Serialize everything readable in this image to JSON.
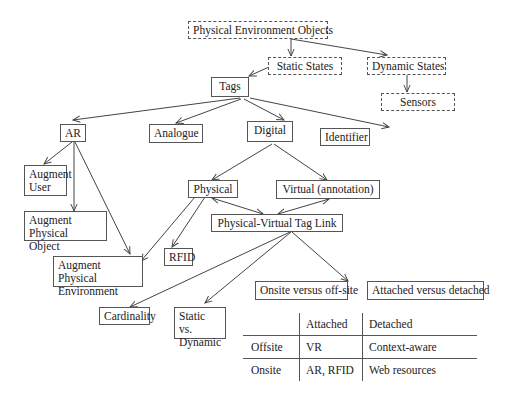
{
  "diagram": {
    "nodes": {
      "peo": "Physical Environment Objects",
      "static_states": "Static States",
      "dynamic_states": "Dynamic States",
      "sensors": "Sensors",
      "tags": "Tags",
      "ar": "AR",
      "analogue": "Analogue",
      "digital": "Digital",
      "identifier": "Identifier",
      "augment_user_1": "Augment",
      "augment_user_2": "User",
      "augment_phys_obj_1": "Augment Physical",
      "augment_phys_obj_2": "Object",
      "augment_phys_env_1": "Augment Physical",
      "augment_phys_env_2": "Environment",
      "physical": "Physical",
      "virtual": "Virtual (annotation)",
      "pv_link": "Physical-Virtual Tag Link",
      "rfid": "RFID",
      "onsite_offsite": "Onsite versus off-site",
      "attached_detached": "Attached versus detached",
      "cardinality": "Cardinality",
      "static_dynamic_1": "Static vs.",
      "static_dynamic_2": "Dynamic"
    },
    "table": {
      "headers": [
        "",
        "Attached",
        "Detached"
      ],
      "rows": [
        [
          "Offsite",
          "VR",
          "Context-aware"
        ],
        [
          "Onsite",
          "AR, RFID",
          "Web resources"
        ]
      ]
    },
    "colors": {
      "line": "#444444",
      "border": "#555555",
      "background": "#ffffff"
    }
  }
}
